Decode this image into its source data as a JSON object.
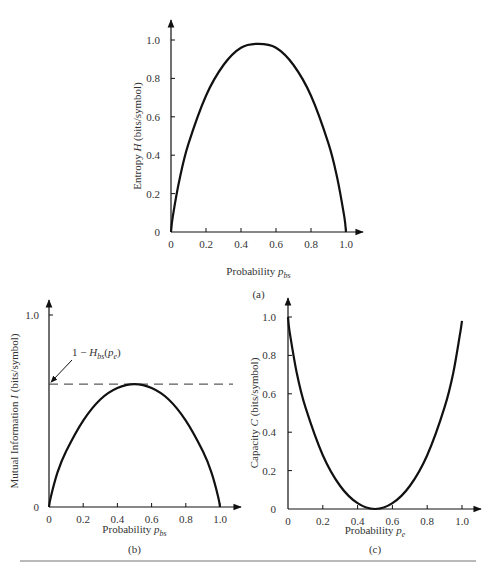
{
  "chart_data": [
    {
      "id": "a",
      "type": "line",
      "caption": "(a)",
      "title": "",
      "xlabel": "Probability p_bs",
      "xlabel_main": "Probability",
      "xlabel_var": "p",
      "xlabel_sub": "bs",
      "ylabel": "Entropy H (bits/symbol)",
      "ylabel_pre": "Entropy",
      "ylabel_var": "H",
      "ylabel_post": "(bits/symbol)",
      "xlim": [
        0,
        1.0
      ],
      "ylim": [
        0,
        1.0
      ],
      "x_ticks": [
        "0",
        "0.2",
        "0.4",
        "0.6",
        "0.8",
        "1.0"
      ],
      "y_ticks": [
        "0",
        "0.2",
        "0.4",
        "0.6",
        "0.8",
        "1.0"
      ],
      "grid": false,
      "series": [
        {
          "name": "Binary entropy H(p)",
          "x": [
            0,
            0.01,
            0.05,
            0.1,
            0.2,
            0.3,
            0.4,
            0.5,
            0.6,
            0.7,
            0.8,
            0.9,
            0.95,
            0.99,
            1.0
          ],
          "y": [
            0,
            0.08,
            0.28,
            0.46,
            0.71,
            0.87,
            0.96,
            0.98,
            0.96,
            0.87,
            0.71,
            0.46,
            0.28,
            0.08,
            0
          ]
        }
      ]
    },
    {
      "id": "b",
      "type": "line",
      "caption": "(b)",
      "title": "",
      "xlabel": "Probability p_bs",
      "xlabel_main": "Probability",
      "xlabel_var": "p",
      "xlabel_sub": "bs",
      "ylabel": "Mutual Information I (bits/symbol)",
      "ylabel_pre": "Mutual Information",
      "ylabel_var": "I",
      "ylabel_post": "(bits/symbol)",
      "xlim": [
        0,
        1.0
      ],
      "ylim": [
        0,
        1.0
      ],
      "x_ticks": [
        "0",
        "0.2",
        "0.4",
        "0.6",
        "0.8",
        "1.0"
      ],
      "y_ticks": [
        "0",
        "1.0"
      ],
      "grid": false,
      "annotations": [
        {
          "text": "1 − H_bs(p_e)",
          "pre": "1 − ",
          "var": "H",
          "sub": "bs",
          "arg_open": "(",
          "arg_var": "p",
          "arg_sub": "e",
          "arg_close": ")",
          "y_value": 0.64,
          "style": "dashed horizontal line with arrow to y-axis"
        }
      ],
      "series": [
        {
          "name": "Mutual information I",
          "x": [
            0,
            0.01,
            0.05,
            0.1,
            0.2,
            0.3,
            0.4,
            0.5,
            0.6,
            0.7,
            0.8,
            0.9,
            0.95,
            0.99,
            1.0
          ],
          "y": [
            0,
            0.05,
            0.18,
            0.29,
            0.45,
            0.56,
            0.62,
            0.64,
            0.62,
            0.56,
            0.45,
            0.29,
            0.18,
            0.05,
            0
          ]
        },
        {
          "name": "1 − H_bs(p_e)",
          "x": [
            0,
            1.0
          ],
          "y": [
            0.64,
            0.64
          ],
          "style": "dashed"
        }
      ]
    },
    {
      "id": "c",
      "type": "line",
      "caption": "(c)",
      "title": "",
      "xlabel": "Probability p_e",
      "xlabel_main": "Probability",
      "xlabel_var": "p",
      "xlabel_sub": "e",
      "ylabel": "Capacity C (bits/symbol)",
      "ylabel_pre": "Capacity",
      "ylabel_var": "C",
      "ylabel_post": "(bits/symbol)",
      "xlim": [
        0,
        1.0
      ],
      "ylim": [
        0,
        1.0
      ],
      "x_ticks": [
        "0",
        "0.2",
        "0.4",
        "0.6",
        "0.8",
        "1.0"
      ],
      "y_ticks": [
        "0",
        "0.2",
        "0.4",
        "0.6",
        "0.8",
        "1.0"
      ],
      "grid": false,
      "series": [
        {
          "name": "Capacity C = 1 − H(p_e)",
          "x": [
            0,
            0.01,
            0.05,
            0.1,
            0.2,
            0.3,
            0.4,
            0.5,
            0.6,
            0.7,
            0.8,
            0.9,
            0.95,
            0.99,
            1.0
          ],
          "y": [
            1.0,
            0.92,
            0.71,
            0.53,
            0.28,
            0.12,
            0.03,
            0,
            0.03,
            0.12,
            0.28,
            0.53,
            0.71,
            0.92,
            0.98
          ]
        }
      ]
    }
  ]
}
